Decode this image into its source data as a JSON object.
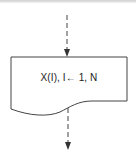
{
  "diagram": {
    "type": "flowchart-document-symbol",
    "symbol": {
      "shape": "document",
      "label": "X(I), I← 1, N"
    },
    "flow_in": {
      "style": "dashed",
      "direction": "down"
    },
    "flow_out": {
      "style": "dashed",
      "direction": "down"
    },
    "colors": {
      "stroke": "#333333",
      "background": "#ffffff"
    }
  }
}
